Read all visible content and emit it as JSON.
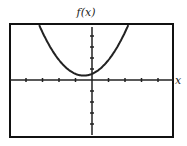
{
  "chart_data": {
    "type": "line",
    "title": "",
    "xlabel": "x",
    "ylabel": "f(x)",
    "xlim": [
      -5,
      5
    ],
    "ylim": [
      -5,
      5
    ],
    "x_ticks": [
      -4,
      -3,
      -2,
      -1,
      1,
      2,
      3,
      4
    ],
    "y_ticks": [
      -4,
      -3,
      -2,
      -1,
      1,
      2,
      3,
      4
    ],
    "tick_labels_shown": false,
    "grid": false,
    "series": [
      {
        "name": "f(x)",
        "description": "upward-opening parabola, vertex near (-0.5, 0.4)",
        "x": [
          -3.3,
          -3,
          -2.5,
          -2,
          -1.5,
          -1,
          -0.5,
          0,
          0.5,
          1,
          1.5,
          2,
          2.2
        ],
        "y": [
          5.3,
          4.4,
          2.9,
          1.8,
          1.0,
          0.56,
          0.4,
          0.56,
          1.0,
          1.8,
          2.9,
          4.4,
          5.0
        ]
      }
    ],
    "colors": {
      "curve": "#222222",
      "axes": "#222222",
      "frame": "#111111"
    }
  }
}
